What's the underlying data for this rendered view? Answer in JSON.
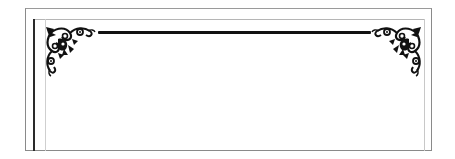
{
  "frame": {
    "type": "decorative-border",
    "colors": {
      "outer_border": "#8a8a8a",
      "inner_dark_line": "#2a2a2a",
      "inner_light_line": "#b5b5b5",
      "ornament": "#111111",
      "background": "#ffffff"
    },
    "ornaments": [
      {
        "position": "top-left",
        "icon": "floral-corner-icon"
      },
      {
        "position": "top-right",
        "icon": "floral-corner-icon"
      }
    ],
    "rule": {
      "position": "top",
      "style": "thick-line"
    }
  }
}
